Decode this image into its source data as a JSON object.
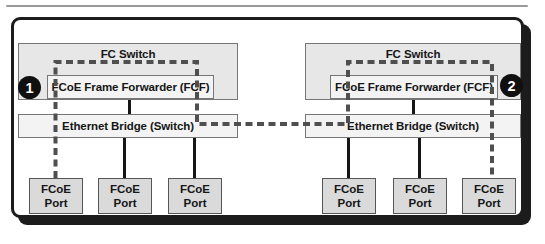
{
  "diagram": {
    "callouts": [
      {
        "label": "1"
      },
      {
        "label": "2"
      }
    ],
    "left": {
      "fc_switch_label": "FC Switch",
      "fcf_label": "FCoE Frame Forwarder (FCF)",
      "bridge_label": "Ethernet Bridge (Switch)",
      "ports": [
        {
          "line1": "FCoE",
          "line2": "Port"
        },
        {
          "line1": "FCoE",
          "line2": "Port"
        },
        {
          "line1": "FCoE",
          "line2": "Port"
        }
      ]
    },
    "right": {
      "fc_switch_label": "FC Switch",
      "fcf_label": "FCoE Frame Forwarder (FCF)",
      "bridge_label": "Ethernet Bridge (Switch)",
      "ports": [
        {
          "line1": "FCoE",
          "line2": "Port"
        },
        {
          "line1": "FCoE",
          "line2": "Port"
        },
        {
          "line1": "FCoE",
          "line2": "Port"
        }
      ]
    },
    "colors": {
      "dashed_virtual_link": "#4f4f4f",
      "frame_border": "#1c1c1c",
      "fc_switch_fill": "#e7e7e7",
      "fcf_fill": "#f3f3f3",
      "bridge_fill": "#f3f3f3",
      "port_fill": "#dadada"
    }
  }
}
